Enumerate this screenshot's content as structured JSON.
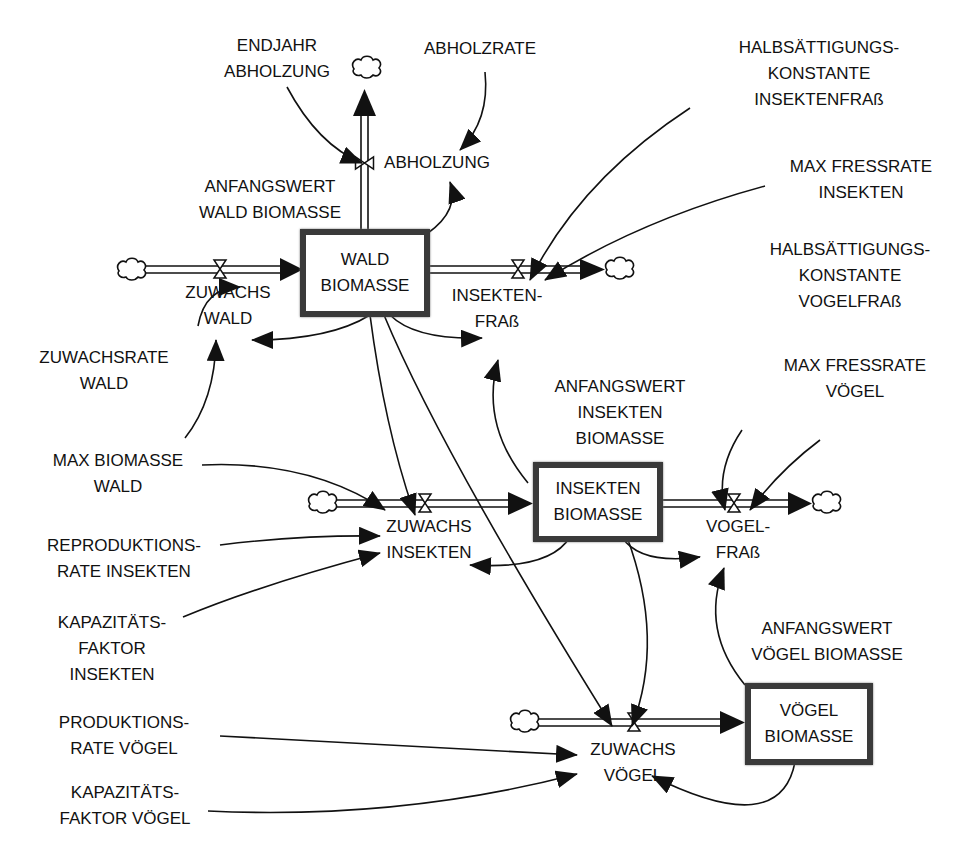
{
  "diagram": {
    "type": "stock-and-flow",
    "stocks": {
      "wald": {
        "line1": "WALD",
        "line2": "BIOMASSE"
      },
      "insekten": {
        "line1": "INSEKTEN",
        "line2": "BIOMASSE"
      },
      "voegel": {
        "line1": "VÖGEL",
        "line2": "BIOMASSE"
      }
    },
    "flows": {
      "abholzung": {
        "line1": "ABHOLZUNG"
      },
      "zuwachs_wald": {
        "line1": "ZUWACHS",
        "line2": "WALD"
      },
      "insektenfrass": {
        "line1": "INSEKTEN-",
        "line2": "FRAß"
      },
      "zuwachs_insekten": {
        "line1": "ZUWACHS",
        "line2": "INSEKTEN"
      },
      "vogelfrass": {
        "line1": "VOGEL-",
        "line2": "FRAß"
      },
      "zuwachs_voegel": {
        "line1": "ZUWACHS",
        "line2": "VÖGEL"
      }
    },
    "variables": {
      "endjahr_abholzung": {
        "line1": "ENDJAHR",
        "line2": "ABHOLZUNG"
      },
      "abholzrate": {
        "line1": "ABHOLZRATE"
      },
      "anfangswert_wald": {
        "line1": "ANFANGSWERT",
        "line2": "WALD BIOMASSE"
      },
      "halbsaett_insektenfrass": {
        "line1": "HALBSÄTTIGUNGS-",
        "line2": "KONSTANTE",
        "line3": "INSEKTENFRAß"
      },
      "max_fressrate_insekten": {
        "line1": "MAX FRESSRATE",
        "line2": "INSEKTEN"
      },
      "halbsaett_vogelfrass": {
        "line1": "HALBSÄTTIGUNGS-",
        "line2": "KONSTANTE",
        "line3": "VOGELFRAß"
      },
      "max_fressrate_voegel": {
        "line1": "MAX FRESSRATE",
        "line2": "VÖGEL"
      },
      "zuwachsrate_wald": {
        "line1": "ZUWACHSRATE",
        "line2": "WALD"
      },
      "anfangswert_insekten": {
        "line1": "ANFANGSWERT",
        "line2": "INSEKTEN",
        "line3": "BIOMASSE"
      },
      "max_biomasse_wald": {
        "line1": "MAX BIOMASSE",
        "line2": "WALD"
      },
      "reproduktionsrate_insekten": {
        "line1": "REPRODUKTIONS-",
        "line2": "RATE INSEKTEN"
      },
      "kapazitaetsfaktor_insekten": {
        "line1": "KAPAZITÄTS-",
        "line2": "FAKTOR",
        "line3": "INSEKTEN"
      },
      "anfangswert_voegel": {
        "line1": "ANFANGSWERT",
        "line2": "VÖGEL BIOMASSE"
      },
      "produktionsrate_voegel": {
        "line1": "PRODUKTIONS-",
        "line2": "RATE VÖGEL"
      },
      "kapazitaetsfaktor_voegel": {
        "line1": "KAPAZITÄTS-",
        "line2": "FAKTOR VÖGEL"
      }
    },
    "colors": {
      "line": "#111111",
      "stock_border": "#3a3a3a",
      "background": "#ffffff"
    }
  }
}
